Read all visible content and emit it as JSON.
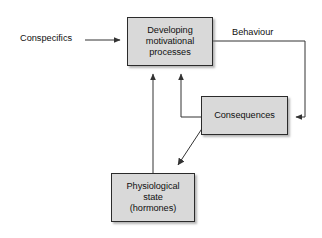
{
  "diagram": {
    "background_color": "#ffffff",
    "box_fill_color": "#d9d9d9",
    "box_border_color": "#2b2b2b",
    "line_color": "#333333",
    "text_color": "#101010",
    "nodes": [
      {
        "id": "motivational",
        "label": "Developing\nmotivational\nprocesses",
        "x": 127,
        "y": 17,
        "width": 86,
        "height": 49
      },
      {
        "id": "consequences",
        "label": "Consequences",
        "x": 201,
        "y": 96,
        "width": 87,
        "height": 39
      },
      {
        "id": "physiological",
        "label": "Physiological\nstate\n(hormones)",
        "x": 111,
        "y": 173,
        "width": 84,
        "height": 49
      }
    ],
    "edge_labels": [
      {
        "id": "conspecifics",
        "label": "Conspecifics",
        "x": 20,
        "y": 33
      },
      {
        "id": "behaviour",
        "label": "Behaviour",
        "x": 232,
        "y": 27
      }
    ],
    "edges": [
      {
        "id": "conspecifics-to-motivational",
        "from": "Conspecifics",
        "to": "Developing motivational processes",
        "style": "straight-arrow"
      },
      {
        "id": "motivational-to-consequences",
        "from": "Developing motivational processes",
        "to": "Consequences",
        "label": "Behaviour",
        "style": "orthogonal-arrow"
      },
      {
        "id": "consequences-to-motivational",
        "from": "Consequences",
        "to": "Developing motivational processes",
        "style": "orthogonal-arrow"
      },
      {
        "id": "consequences-to-physiological",
        "from": "Consequences",
        "to": "Physiological state (hormones)",
        "style": "diagonal-arrow"
      },
      {
        "id": "physiological-to-motivational",
        "from": "Physiological state (hormones)",
        "to": "Developing motivational processes",
        "style": "straight-arrow"
      }
    ]
  }
}
